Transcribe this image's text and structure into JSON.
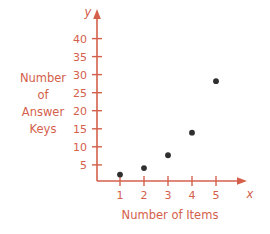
{
  "chart_data": {
    "type": "scatter",
    "title": "",
    "subtitle": "",
    "xlabel": "Number of Items",
    "ylabel": "Number of Answer Keys",
    "x_axis_variable": "x",
    "y_axis_variable": "y",
    "x": [
      1,
      2,
      3,
      4,
      5
    ],
    "values": [
      2,
      4,
      8,
      15,
      31
    ],
    "series": [
      {
        "name": "Answer Keys",
        "x": [
          1,
          2,
          3,
          4,
          5
        ],
        "values": [
          2,
          4,
          8,
          15,
          31
        ]
      }
    ],
    "xlim": [
      0,
      6
    ],
    "ylim": [
      0,
      44
    ],
    "xticks": [
      1,
      2,
      3,
      4,
      5
    ],
    "yticks": [
      5,
      10,
      15,
      20,
      25,
      30,
      35,
      40
    ],
    "xtick_labels": [
      "1",
      "2",
      "3",
      "4",
      "5"
    ],
    "ytick_labels": [
      "5",
      "10",
      "15",
      "20",
      "25",
      "30",
      "35",
      "40"
    ],
    "grid": false,
    "legend": false,
    "legend_position": "none",
    "annotations": [],
    "axis_color": "#d4604c",
    "point_color": "#2f2f2f",
    "background_color": "#ffffff"
  },
  "labels": {
    "y_axis_label_lines": [
      "Number",
      "of",
      "Answer",
      "Keys"
    ],
    "x_axis_label": "Number of Items",
    "x_axis_variable": "x",
    "y_axis_variable": "y"
  },
  "ticks": {
    "y": [
      "40",
      "35",
      "30",
      "25",
      "20",
      "15",
      "10",
      "5"
    ],
    "x": [
      "1",
      "2",
      "3",
      "4",
      "5"
    ]
  }
}
